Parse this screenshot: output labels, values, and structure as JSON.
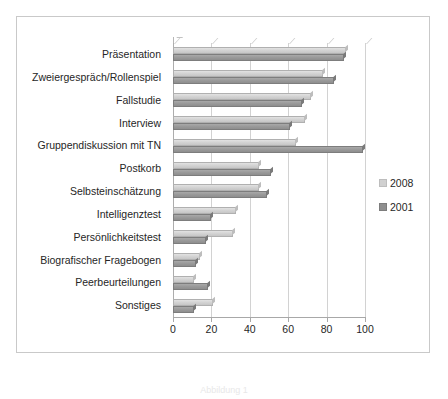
{
  "caption": "Abbildung 1",
  "legend": {
    "position": "right",
    "entries": [
      {
        "label": "2008",
        "color": "#d0d0d0"
      },
      {
        "label": "2001",
        "color": "#8f8f8f"
      }
    ]
  },
  "axis": {
    "ticks": [
      0,
      20,
      40,
      60,
      80,
      100
    ]
  },
  "chart_data": {
    "type": "bar",
    "orientation": "horizontal",
    "title": "",
    "subtitle": "",
    "xlabel": "",
    "ylabel": "",
    "xlim": [
      0,
      100
    ],
    "xticks": [
      0,
      20,
      40,
      60,
      80,
      100
    ],
    "grid": true,
    "legend_position": "right",
    "categories": [
      "Präsentation",
      "Zweiergespräch/Rollenspiel",
      "Fallstudie",
      "Interview",
      "Gruppendiskussion mit TN",
      "Postkorb",
      "Selbsteinschätzung",
      "Intelligenztest",
      "Persönlichkeitstest",
      "Biografischer Fragebogen",
      "Peerbeurteilungen",
      "Sonstiges"
    ],
    "series": [
      {
        "name": "2008",
        "color": "#d0d0d0",
        "values": [
          90,
          78,
          72,
          69,
          64,
          45,
          45,
          33,
          31,
          14,
          11,
          21
        ]
      },
      {
        "name": "2001",
        "color": "#8f8f8f",
        "values": [
          89,
          84,
          67,
          61,
          99,
          51,
          49,
          20,
          17,
          12,
          18,
          11
        ]
      }
    ]
  }
}
